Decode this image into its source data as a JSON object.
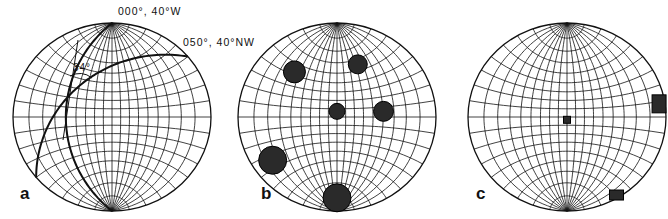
{
  "figure": {
    "type": "stereonet-panels",
    "net_type": "Wulff equal-angle net",
    "grid_interval_deg": 10,
    "ink_color": "#111111",
    "fill_color": "#2a2a2a",
    "background": "#ffffff",
    "panels": [
      {
        "id": "a",
        "label": "a",
        "planes": [
          {
            "label": "000°, 40°W",
            "strike_deg": 0,
            "dip_deg": 40,
            "dip_dir": "W"
          },
          {
            "label": "050°, 40°NW",
            "strike_deg": 50,
            "dip_deg": 40,
            "dip_dir": "NW"
          }
        ],
        "angle_label": "34°",
        "angle_value_deg": 34
      },
      {
        "id": "b",
        "label": "b",
        "markers": [
          {
            "shape": "circle",
            "size": "medium",
            "position": "upper-left"
          },
          {
            "shape": "circle",
            "size": "small",
            "position": "upper-right"
          },
          {
            "shape": "circle",
            "size": "small",
            "position": "center"
          },
          {
            "shape": "circle",
            "size": "small",
            "position": "right"
          },
          {
            "shape": "circle",
            "size": "large",
            "position": "lower-left"
          },
          {
            "shape": "circle",
            "size": "large",
            "position": "bottom"
          }
        ]
      },
      {
        "id": "c",
        "label": "c",
        "markers": [
          {
            "shape": "square",
            "size": "small",
            "position": "center"
          },
          {
            "shape": "rectangle",
            "size": "medium",
            "position": "right-edge"
          },
          {
            "shape": "rectangle",
            "size": "medium",
            "position": "lower-right-edge"
          }
        ]
      }
    ]
  }
}
